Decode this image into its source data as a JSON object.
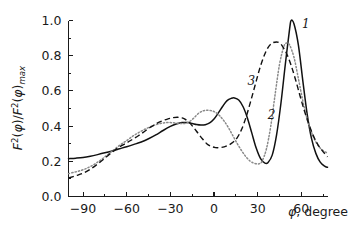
{
  "chart_data": {
    "type": "line",
    "title": "",
    "subtitle": "",
    "xlabel": "φ, degree",
    "ylabel": "F²(φ)/F²(φ)max",
    "ylabel_parts": {
      "f": "F",
      "exp": "2",
      "arg_open": "(",
      "phi": "φ",
      "arg_close": ")",
      "slash": "/",
      "sub": "max"
    },
    "xlim": [
      -100,
      78
    ],
    "ylim": [
      0.0,
      1.0
    ],
    "grid": false,
    "legend": "inline-curve-labels",
    "x_ticks": [
      -90,
      -60,
      -30,
      0,
      30,
      60
    ],
    "x_tick_labels": [
      "−90",
      "−60",
      "−30",
      "0",
      "30",
      "60"
    ],
    "x_minor_ticks": [
      -75,
      -45,
      -15,
      15,
      45,
      75
    ],
    "y_ticks": [
      0.0,
      0.2,
      0.4,
      0.6,
      0.8,
      1.0
    ],
    "y_tick_labels": [
      "0.0",
      "0.2",
      "0.4",
      "0.6",
      "0.8",
      "1.0"
    ],
    "y_minor_ticks": [
      0.1,
      0.3,
      0.5,
      0.7,
      0.9
    ],
    "series": [
      {
        "name": "1",
        "label": "1",
        "style": "solid",
        "color": "#111111",
        "label_x": 60.5,
        "label_y": 0.955,
        "x": [
          -100,
          -95,
          -90,
          -85,
          -80,
          -75,
          -70,
          -65,
          -60,
          -55,
          -50,
          -45,
          -40,
          -35,
          -30,
          -26,
          -22,
          -20,
          -18,
          -15,
          -12,
          -9,
          -6,
          -3,
          0,
          3,
          6,
          9,
          12,
          14,
          17,
          20,
          23,
          26,
          29,
          32,
          35,
          37,
          40,
          43,
          46,
          49,
          52,
          53,
          55,
          58,
          61,
          64,
          67,
          70,
          73,
          76,
          78
        ],
        "y": [
          0.215,
          0.218,
          0.222,
          0.229,
          0.238,
          0.248,
          0.259,
          0.271,
          0.283,
          0.296,
          0.31,
          0.328,
          0.35,
          0.375,
          0.398,
          0.412,
          0.42,
          0.421,
          0.42,
          0.415,
          0.409,
          0.406,
          0.408,
          0.418,
          0.44,
          0.475,
          0.513,
          0.545,
          0.558,
          0.56,
          0.548,
          0.51,
          0.445,
          0.36,
          0.275,
          0.215,
          0.19,
          0.192,
          0.235,
          0.35,
          0.53,
          0.75,
          0.955,
          1.0,
          0.98,
          0.86,
          0.66,
          0.47,
          0.33,
          0.245,
          0.195,
          0.172,
          0.166
        ]
      },
      {
        "name": "2",
        "label": "2",
        "style": "dotted",
        "color": "#8a8a8a",
        "label_x": 37.0,
        "label_y": 0.44,
        "x": [
          -100,
          -95,
          -90,
          -85,
          -80,
          -75,
          -70,
          -65,
          -60,
          -56,
          -52,
          -48,
          -44,
          -40,
          -36,
          -32,
          -28,
          -24,
          -20,
          -17,
          -14,
          -11,
          -8,
          -5,
          -2,
          1,
          4,
          7,
          10,
          13,
          16,
          19,
          22,
          25,
          28,
          31,
          33,
          36,
          39,
          42,
          45,
          48,
          50,
          52,
          55,
          58,
          61,
          64,
          67,
          70,
          73,
          76,
          78
        ],
        "y": [
          0.13,
          0.14,
          0.152,
          0.17,
          0.195,
          0.225,
          0.258,
          0.29,
          0.318,
          0.342,
          0.362,
          0.38,
          0.395,
          0.408,
          0.416,
          0.42,
          0.419,
          0.415,
          0.415,
          0.425,
          0.445,
          0.47,
          0.485,
          0.49,
          0.488,
          0.478,
          0.458,
          0.428,
          0.39,
          0.345,
          0.3,
          0.26,
          0.225,
          0.2,
          0.188,
          0.186,
          0.2,
          0.27,
          0.4,
          0.58,
          0.75,
          0.852,
          0.872,
          0.86,
          0.79,
          0.67,
          0.545,
          0.44,
          0.365,
          0.31,
          0.275,
          0.255,
          0.248
        ]
      },
      {
        "name": "3",
        "label": "3",
        "style": "dashed",
        "color": "#111111",
        "label_x": 23.0,
        "label_y": 0.635,
        "x": [
          -100,
          -95,
          -90,
          -85,
          -80,
          -75,
          -70,
          -65,
          -60,
          -56,
          -52,
          -48,
          -44,
          -40,
          -36,
          -32,
          -28,
          -25,
          -22,
          -20,
          -17,
          -14,
          -11,
          -8,
          -5,
          -2,
          1,
          4,
          7,
          10,
          13,
          16,
          19,
          22,
          25,
          28,
          31,
          34,
          37,
          40,
          43,
          45,
          47,
          50,
          53,
          56,
          59,
          62,
          65,
          68,
          71,
          74,
          78
        ],
        "y": [
          0.105,
          0.118,
          0.132,
          0.155,
          0.185,
          0.218,
          0.252,
          0.282,
          0.305,
          0.325,
          0.345,
          0.368,
          0.392,
          0.412,
          0.428,
          0.44,
          0.448,
          0.45,
          0.447,
          0.44,
          0.42,
          0.392,
          0.36,
          0.328,
          0.3,
          0.285,
          0.278,
          0.278,
          0.282,
          0.292,
          0.308,
          0.335,
          0.382,
          0.45,
          0.535,
          0.625,
          0.715,
          0.79,
          0.845,
          0.872,
          0.878,
          0.872,
          0.855,
          0.81,
          0.745,
          0.665,
          0.575,
          0.49,
          0.415,
          0.35,
          0.3,
          0.265,
          0.225
        ]
      }
    ]
  },
  "axis": {
    "x_caption": "φ, degree"
  }
}
